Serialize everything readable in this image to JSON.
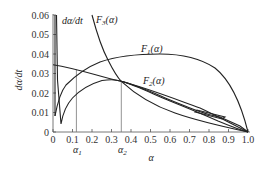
{
  "chart_data": {
    "type": "line",
    "title": "",
    "xlabel": "α",
    "ylabel": "dα/dt",
    "xlim": [
      0,
      1.0
    ],
    "ylim": [
      0,
      0.06
    ],
    "grid": false,
    "x_ticks": [
      "0",
      "0.1",
      "0.2",
      "0.3",
      "0.4",
      "0.5",
      "0.6",
      "0.7",
      "0.8",
      "0.9",
      "1.0"
    ],
    "y_ticks": [
      "0",
      "0.01",
      "0.02",
      "0.03",
      "0.04",
      "0.05",
      "0.06"
    ],
    "markers": [
      {
        "name": "α1",
        "x": 0.12
      },
      {
        "name": "α2",
        "x": 0.35
      }
    ],
    "series": [
      {
        "name": "dα/dt",
        "x": [
          0.02,
          0.02,
          0.04,
          0.06,
          0.1,
          0.15,
          0.2,
          0.3,
          0.35,
          0.45,
          0.6,
          0.7,
          0.85,
          1.0
        ],
        "values": [
          0.06,
          0.03,
          0.004,
          0.012,
          0.019,
          0.024,
          0.027,
          0.0275,
          0.026,
          0.022,
          0.015,
          0.0105,
          0.0055,
          0.0
        ]
      },
      {
        "name": "F1(α)",
        "x": [
          0.01,
          0.03,
          0.06,
          0.1,
          0.15,
          0.2,
          0.3,
          0.4,
          0.5,
          0.55,
          0.6,
          0.7,
          0.8,
          0.9,
          1.0
        ],
        "values": [
          0.008,
          0.017,
          0.024,
          0.029,
          0.033,
          0.036,
          0.0385,
          0.0398,
          0.04,
          0.04,
          0.0395,
          0.0365,
          0.03,
          0.018,
          0.0
        ]
      },
      {
        "name": "F2(α)",
        "x": [
          0.0,
          0.12,
          0.35,
          0.5,
          0.7,
          0.85,
          1.0
        ],
        "values": [
          0.0345,
          0.032,
          0.026,
          0.022,
          0.0155,
          0.0085,
          0.0
        ]
      },
      {
        "name": "F3(α)",
        "x": [
          0.2,
          0.25,
          0.3,
          0.35,
          0.45,
          0.6,
          0.75,
          0.9,
          1.0
        ],
        "values": [
          0.06,
          0.045,
          0.034,
          0.027,
          0.019,
          0.011,
          0.006,
          0.003,
          0.0
        ]
      }
    ],
    "annotations": [
      {
        "text": "dα/dt",
        "x": 0.06,
        "y": 0.057
      },
      {
        "text": "F3(α)",
        "x": 0.25,
        "y": 0.057
      },
      {
        "text": "F1(α)",
        "x": 0.55,
        "y": 0.043
      },
      {
        "text": "F2(α)",
        "x": 0.57,
        "y": 0.029
      }
    ]
  },
  "labels": {
    "y_axis": "dα/dt",
    "x_axis": "α",
    "alpha1": "α",
    "alpha1_sub": "1",
    "alpha2": "α",
    "alpha2_sub": "2",
    "curve_dadt": "dα/dt",
    "curve_f3": "F",
    "curve_f3_sub": "3",
    "curve_f1": "F",
    "curve_f1_sub": "1",
    "curve_f2": "F",
    "curve_f2_sub": "2",
    "arg": "(α)"
  }
}
